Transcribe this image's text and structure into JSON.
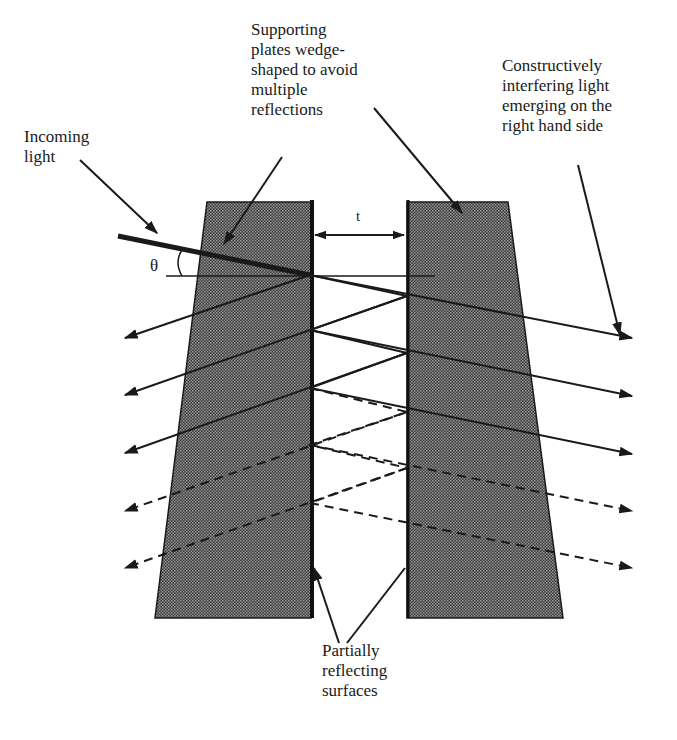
{
  "diagram": {
    "type": "Fabry-Perot etalon with wedge-shaped supporting plates",
    "labels": {
      "incoming": "Incoming\nlight",
      "supporting": "Supporting\nplates wedge-\nshaped to avoid\nmultiple\nreflections",
      "constructive": "Constructively\ninterfering light\nemerging on the\nright hand side",
      "partial": "Partially\nreflecting\nsurfaces",
      "angle": "θ",
      "gap": "t"
    },
    "colors": {
      "plate_fill": "#5a5a5a",
      "line": "#1a1a1a",
      "background": "#ffffff"
    },
    "elements": {
      "plates": [
        "left wedge plate",
        "right wedge plate"
      ],
      "solid_rays_left": 3,
      "dashed_rays_left": 2,
      "solid_rays_right": 3,
      "dashed_rays_right": 2
    }
  }
}
